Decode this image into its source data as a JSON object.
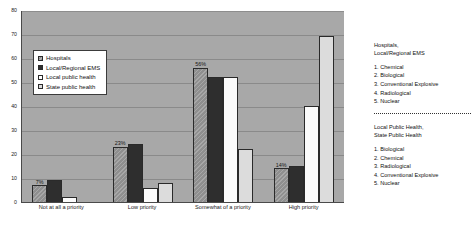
{
  "chart_data": {
    "type": "bar",
    "title": "",
    "xlabel": "",
    "ylabel": "",
    "ylim": [
      0,
      80
    ],
    "yticks": [
      0,
      10,
      20,
      30,
      40,
      50,
      60,
      70,
      80
    ],
    "grid": true,
    "legend_position": "inside-top-left",
    "categories": [
      "Not at all a priority",
      "Low priority",
      "Somewhat of a priority",
      "High priority"
    ],
    "series": [
      {
        "name": "Hospitals",
        "values": [
          7,
          23,
          56,
          14
        ],
        "color": "#8f8f8f"
      },
      {
        "name": "Local/Regional EMS",
        "values": [
          9,
          24,
          52,
          15
        ],
        "color": "#2e2e2e"
      },
      {
        "name": "Local public health",
        "values": [
          2,
          6,
          52,
          40
        ],
        "color": "#fbfbfb"
      },
      {
        "name": "State public health",
        "values": [
          0,
          8,
          22,
          69
        ],
        "color": "#dcdcdc"
      }
    ],
    "data_labels": {
      "Not at all a priority": "7%",
      "Low priority": "23%",
      "Somewhat of a priority": "56%",
      "High priority": "14%"
    }
  },
  "notes": {
    "block1": {
      "heading_line1": "Hospitals,",
      "heading_line2": "Local/Regional EMS",
      "items": [
        "1. Chemical",
        "2. Biological",
        "3. Conventional Explosive",
        "4. Radiological",
        "5. Nuclear"
      ]
    },
    "block2": {
      "heading_line1": "Local Public Health,",
      "heading_line2": "State Public Health",
      "items": [
        "1. Biological",
        "2. Chemical",
        "3. Radiological",
        "4. Conventional Explosive",
        "5. Nuclear"
      ]
    }
  }
}
